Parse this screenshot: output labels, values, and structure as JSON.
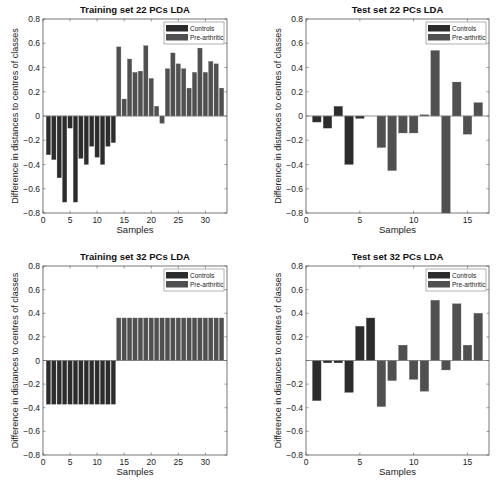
{
  "colors": {
    "controls": "#2c2c2c",
    "pre_arthritic": "#505050",
    "axis": "#555555",
    "zero_line": "#777777"
  },
  "chart_data": [
    {
      "id": "train22",
      "type": "bar",
      "title": "Training set 22 PCs  LDA",
      "xlabel": "Samples",
      "ylabel": "Difference in distances to centres of classes",
      "xlim": [
        0,
        34
      ],
      "ylim": [
        -0.8,
        0.8
      ],
      "xticks": [
        0,
        5,
        10,
        15,
        20,
        25,
        30
      ],
      "yticks": [
        "0.8",
        "0.6",
        "0.4",
        "0.2",
        "0",
        "−0.2",
        "−0.4",
        "−0.6",
        "−0.8"
      ],
      "legend": [
        "Controls",
        "Pre-arthritic"
      ],
      "legend_position": "upper right",
      "grid": false,
      "series": [
        {
          "name": "Controls",
          "x": [
            1,
            2,
            3,
            4,
            5,
            6,
            7,
            8,
            9,
            10,
            11,
            12,
            13
          ],
          "values": [
            -0.32,
            -0.36,
            -0.51,
            -0.71,
            -0.1,
            -0.71,
            -0.35,
            -0.4,
            -0.25,
            -0.34,
            -0.4,
            -0.25,
            -0.22
          ]
        },
        {
          "name": "Pre-arthritic",
          "x": [
            14,
            15,
            16,
            17,
            18,
            19,
            20,
            21,
            22,
            23,
            24,
            25,
            26,
            27,
            28,
            29,
            30,
            31,
            32,
            33
          ],
          "values": [
            0.57,
            0.14,
            0.47,
            0.36,
            0.37,
            0.58,
            0.31,
            0.08,
            -0.06,
            0.39,
            0.52,
            0.43,
            0.39,
            0.23,
            0.36,
            0.56,
            0.36,
            0.45,
            0.43,
            0.23
          ]
        }
      ]
    },
    {
      "id": "test22",
      "type": "bar",
      "title": "Test set 22 PCs  LDA",
      "xlabel": "Samples",
      "ylabel": "Difference in distances to centres of classes",
      "xlim": [
        0,
        17
      ],
      "ylim": [
        -0.8,
        0.8
      ],
      "xticks": [
        0,
        5,
        10,
        15
      ],
      "yticks": [
        "0.8",
        "0.6",
        "0.4",
        "0.2",
        "0",
        "−0.2",
        "−0.4",
        "−0.6",
        "−0.8"
      ],
      "legend": [
        "Controls",
        "Pre-arthritic"
      ],
      "legend_position": "upper right",
      "grid": false,
      "series": [
        {
          "name": "Controls",
          "x": [
            1,
            2,
            3,
            4,
            5
          ],
          "values": [
            -0.05,
            -0.1,
            0.08,
            -0.4,
            -0.02
          ]
        },
        {
          "name": "Pre-arthritic",
          "x": [
            7,
            8,
            9,
            10,
            11,
            12,
            13,
            14,
            15,
            16
          ],
          "values": [
            -0.26,
            -0.45,
            -0.14,
            -0.14,
            0.01,
            0.54,
            -0.8,
            0.28,
            -0.15,
            0.11
          ]
        }
      ]
    },
    {
      "id": "train32",
      "type": "bar",
      "title": "Training set 32 PCs  LDA",
      "xlabel": "Samples",
      "ylabel": "Difference in distances to centres of classes",
      "xlim": [
        0,
        34
      ],
      "ylim": [
        -0.8,
        0.8
      ],
      "xticks": [
        0,
        5,
        10,
        15,
        20,
        25,
        30
      ],
      "yticks": [
        "0.8",
        "0.6",
        "0.4",
        "0.2",
        "0",
        "−0.2",
        "−0.4",
        "−0.6",
        "−0.8"
      ],
      "legend": [
        "Controls",
        "Pre-arthritic"
      ],
      "legend_position": "upper right",
      "grid": false,
      "series": [
        {
          "name": "Controls",
          "x": [
            1,
            2,
            3,
            4,
            5,
            6,
            7,
            8,
            9,
            10,
            11,
            12,
            13
          ],
          "values": [
            -0.37,
            -0.37,
            -0.37,
            -0.37,
            -0.37,
            -0.37,
            -0.37,
            -0.37,
            -0.37,
            -0.37,
            -0.37,
            -0.37,
            -0.37
          ]
        },
        {
          "name": "Pre-arthritic",
          "x": [
            14,
            15,
            16,
            17,
            18,
            19,
            20,
            21,
            22,
            23,
            24,
            25,
            26,
            27,
            28,
            29,
            30,
            31,
            32,
            33
          ],
          "values": [
            0.36,
            0.36,
            0.36,
            0.36,
            0.36,
            0.36,
            0.36,
            0.36,
            0.36,
            0.36,
            0.36,
            0.36,
            0.36,
            0.36,
            0.36,
            0.36,
            0.36,
            0.36,
            0.36,
            0.36
          ]
        }
      ]
    },
    {
      "id": "test32",
      "type": "bar",
      "title": "Test set 32 PCs  LDA",
      "xlabel": "Samples",
      "ylabel": "Difference in distances to centres of classes",
      "xlim": [
        0,
        17
      ],
      "ylim": [
        -0.8,
        0.8
      ],
      "xticks": [
        0,
        5,
        10,
        15
      ],
      "yticks": [
        "0.8",
        "0.6",
        "0.4",
        "0.2",
        "",
        "−0.2",
        "−0.4",
        "−0.6",
        "−0.8"
      ],
      "legend": [
        "Controls",
        "Pre-arthritic"
      ],
      "legend_position": "upper right",
      "grid": false,
      "series": [
        {
          "name": "Controls",
          "x": [
            1,
            2,
            3,
            4,
            5,
            6
          ],
          "values": [
            -0.34,
            -0.02,
            -0.02,
            -0.27,
            0.29,
            0.36
          ]
        },
        {
          "name": "Pre-arthritic",
          "x": [
            7,
            8,
            9,
            10,
            11,
            12,
            13,
            14,
            15,
            16
          ],
          "values": [
            -0.39,
            -0.17,
            0.13,
            -0.16,
            -0.26,
            0.51,
            -0.08,
            0.48,
            0.13,
            0.4
          ]
        }
      ]
    }
  ]
}
